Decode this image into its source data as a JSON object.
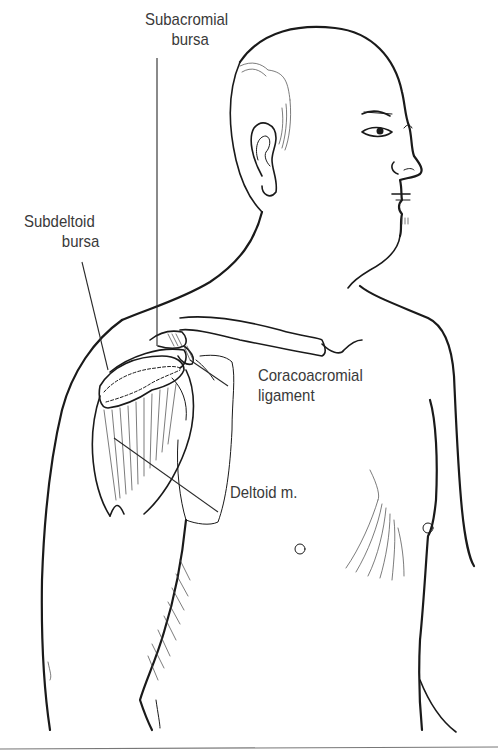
{
  "figure": {
    "type": "anatomical line drawing",
    "labels": [
      {
        "id": "subacromial-bursa",
        "lines": [
          "Subacromial",
          "bursa"
        ]
      },
      {
        "id": "subdeltoid-bursa",
        "lines": [
          "Subdeltoid",
          "bursa"
        ]
      },
      {
        "id": "coracoacromial-ligament",
        "lines": [
          "Coracoacromial",
          "ligament"
        ]
      },
      {
        "id": "deltoid-muscle",
        "lines": [
          "Deltoid m."
        ]
      }
    ]
  },
  "colors": {
    "background": "#ffffff",
    "ink": "#1a1a1a",
    "label_text": "#3a3a3a",
    "rule": "#777777"
  }
}
